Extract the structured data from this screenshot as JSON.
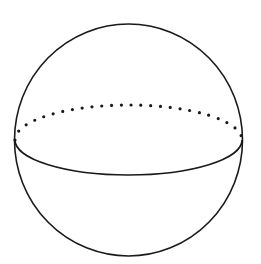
{
  "diagram": {
    "type": "sphere",
    "colors": {
      "background": "#ffffff",
      "stroke": "#1a1a1a"
    },
    "outline": {
      "cx": 128.5,
      "cy": 140,
      "r": 114
    },
    "equator": {
      "cx": 128.5,
      "cy": 140,
      "rx": 113.5,
      "ry": 35,
      "front_style": "solid",
      "back_style": "dotted"
    }
  }
}
